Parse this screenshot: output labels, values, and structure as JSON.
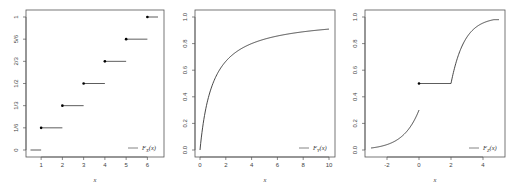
{
  "chart_data": [
    {
      "type": "line",
      "subtype": "step (discrete CDF)",
      "title": "",
      "xlabel": "x",
      "ylabel": "",
      "xlim": [
        0.5,
        6.5
      ],
      "ylim": [
        0,
        1
      ],
      "x_ticks": [
        "1",
        "2",
        "3",
        "4",
        "5",
        "6"
      ],
      "y_ticks": [
        "0",
        "1/6",
        "1/3",
        "1/2",
        "2/3",
        "5/6",
        "1"
      ],
      "legend": {
        "label": "F_X(x)",
        "position": "bottomright"
      },
      "steps": [
        {
          "x_start": 0.5,
          "x_end": 1,
          "y": 0,
          "closed_dot": false
        },
        {
          "x_start": 1,
          "x_end": 2,
          "y": 0.1667,
          "closed_dot": true
        },
        {
          "x_start": 2,
          "x_end": 3,
          "y": 0.3333,
          "closed_dot": true
        },
        {
          "x_start": 3,
          "x_end": 4,
          "y": 0.5,
          "closed_dot": true
        },
        {
          "x_start": 4,
          "x_end": 5,
          "y": 0.6667,
          "closed_dot": true
        },
        {
          "x_start": 5,
          "x_end": 6,
          "y": 0.8333,
          "closed_dot": true
        },
        {
          "x_start": 6,
          "x_end": 6.5,
          "y": 1.0,
          "closed_dot": true
        }
      ],
      "grid": false
    },
    {
      "type": "line",
      "title": "",
      "xlabel": "x",
      "ylabel": "",
      "xlim": [
        0,
        10
      ],
      "ylim": [
        0,
        1
      ],
      "x_ticks": [
        "0",
        "2",
        "4",
        "6",
        "8",
        "10"
      ],
      "y_ticks": [
        "0.0",
        "0.2",
        "0.4",
        "0.6",
        "0.8",
        "1.0"
      ],
      "legend": {
        "label": "F_Y(x)",
        "position": "bottomright"
      },
      "x": [
        0,
        0.5,
        1,
        2,
        3,
        4,
        6,
        8,
        10
      ],
      "values": [
        0,
        0.33,
        0.5,
        0.67,
        0.75,
        0.8,
        0.86,
        0.89,
        0.91
      ],
      "grid": false
    },
    {
      "type": "line",
      "subtype": "mixed CDF",
      "title": "",
      "xlabel": "x",
      "ylabel": "",
      "xlim": [
        -3,
        5
      ],
      "ylim": [
        0,
        1
      ],
      "x_ticks": [
        "-2",
        "0",
        "2",
        "4"
      ],
      "y_ticks": [
        "0.0",
        "0.2",
        "0.4",
        "0.6",
        "0.8",
        "1.0"
      ],
      "legend": {
        "label": "F_Z(x)",
        "position": "bottomright"
      },
      "segments": [
        {
          "x": [
            -3,
            -2,
            -1,
            -0.5,
            0
          ],
          "values": [
            0.015,
            0.04,
            0.11,
            0.18,
            0.3
          ]
        },
        {
          "x": [
            0,
            2
          ],
          "values": [
            0.5,
            0.5
          ],
          "closed_dot_at": 0
        },
        {
          "x": [
            2,
            2.5,
            3,
            4,
            5
          ],
          "values": [
            0.5,
            0.7,
            0.82,
            0.93,
            0.975
          ]
        }
      ],
      "grid": false
    }
  ]
}
